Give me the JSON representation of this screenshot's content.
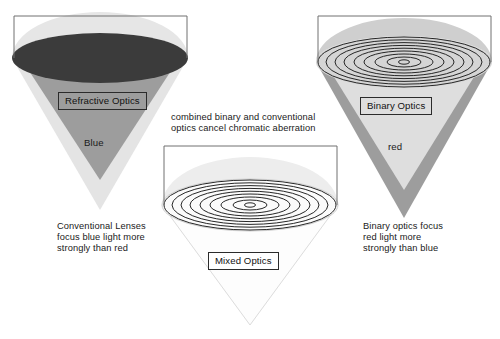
{
  "figure": {
    "background": "#ffffff"
  },
  "palette": {
    "dark_lens": "#3a3a3a",
    "mid_gray_cone": "#9a9a9a",
    "light_gray_cone": "#d8d8d8",
    "pale_gray_cone": "#e9e9e9",
    "lens_dome": "#e3e3e3",
    "frame_line": "#6f6f6f",
    "ring_line": "#2a2a2a",
    "text": "#1a1a1a"
  },
  "panels": {
    "left": {
      "id": "refractive-optics-panel",
      "box_label": "Refractive Optics",
      "color_word": "Blue",
      "caption_lines": [
        "Conventional Lenses",
        "focus blue light more",
        "strongly than red"
      ],
      "lens_type": "smooth-refractive-lens",
      "inner_cone_meaning": "blue focal cone",
      "outer_cone_meaning": "red focal cone"
    },
    "middle": {
      "id": "mixed-optics-panel",
      "box_label": "Mixed Optics",
      "color_word": "",
      "caption_lines": [],
      "lens_type": "hybrid-diffractive-lens",
      "inner_cone_meaning": "achromatic focal cone",
      "outer_cone_meaning": "achromatic focal cone"
    },
    "right": {
      "id": "binary-optics-panel",
      "box_label": "Binary Optics",
      "color_word": "red",
      "caption_lines": [
        "Binary optics focus",
        "red light more",
        "strongly than blue"
      ],
      "lens_type": "binary-diffractive-lens",
      "inner_cone_meaning": "red focal cone",
      "outer_cone_meaning": "blue focal cone"
    }
  },
  "annotation": {
    "id": "center-annotation",
    "lines": [
      "combined binary and conventional",
      "optics cancel chromatic aberration"
    ]
  },
  "ring_counts": {
    "middle_lens": 9,
    "right_lens": 9
  }
}
